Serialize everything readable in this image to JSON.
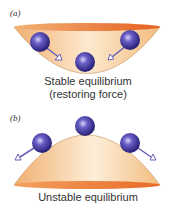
{
  "panel_a": {
    "label": "(a)",
    "caption_line1": "Stable equilibrium",
    "caption_line2": "(restoring force)"
  },
  "panel_b": {
    "label": "(b)",
    "caption": "Unstable equilibrium"
  },
  "colors": {
    "bowl_light": "#fbe3c2",
    "bowl_mid": "#f2bd80",
    "rim": "#e8792e",
    "ball": "#3a2f9a",
    "ball_highlight": "#c8c6f0",
    "arrow": "#6a5fb8"
  }
}
